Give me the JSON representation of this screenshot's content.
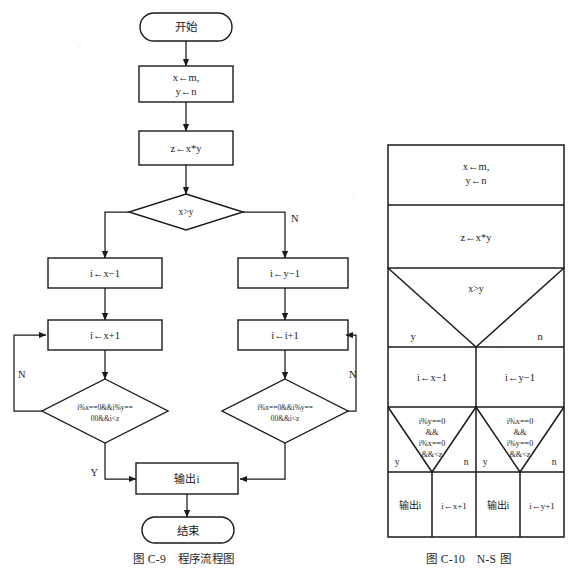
{
  "page": {
    "width": 568,
    "height": 572,
    "background": "#ffffff",
    "ink": "#1a1a1a"
  },
  "flowchart": {
    "caption": "图 C-9　程序流程图",
    "nodes": {
      "start": "开始",
      "init": "x←m,\ny←n",
      "init_line1": "x←m,",
      "init_line2": "y←n",
      "product": "z←x*y",
      "decision_xy": "x>y",
      "left_init": "i←x−1",
      "right_init": "i←y−1",
      "left_step": "i←x+1",
      "right_step": "i←i+1",
      "left_cond_line1": "i%x==0&&i%y==",
      "left_cond_line2": "00&&i<z",
      "right_cond_line1": "i%x==0&&i%y==",
      "right_cond_line2": "00&&i<z",
      "output": "输出i",
      "end": "结束"
    },
    "edge_labels": {
      "xy_no": "N",
      "left_loop_no": "N",
      "right_loop_no": "N",
      "left_yes": "Y"
    }
  },
  "ns_diagram": {
    "caption": "图 C-10　N-S 图",
    "rows": {
      "init_line1": "x←m,",
      "init_line2": "y←n",
      "product": "z←x*y",
      "condition": "x>y",
      "cond_yes": "y",
      "cond_no": "n",
      "left_assign": "i←x−1",
      "right_assign": "i←y−1",
      "left_cond": [
        "i%y==0",
        "&&",
        "i%x==0",
        "&&<z"
      ],
      "left_cond_yes": "y",
      "left_cond_no": "n",
      "right_cond": [
        "i%x==0",
        "&&",
        "i%y==0",
        "&&<z"
      ],
      "right_cond_yes": "y",
      "right_cond_no": "n",
      "cell_out_left": "输出i",
      "cell_inc_left": "i←x+1",
      "cell_out_right": "输出i",
      "cell_inc_right": "i←y+1"
    }
  }
}
